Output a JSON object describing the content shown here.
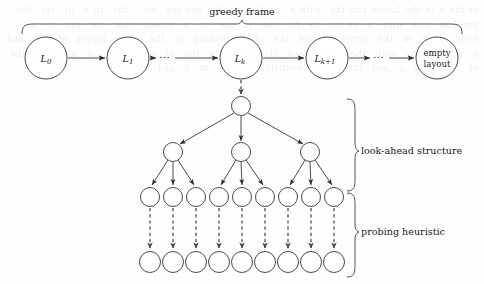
{
  "figure": {
    "background_color": "#fefefe",
    "stroke_color": "#2b2b2b",
    "dashed_stroke_color": "#4a4a4a"
  },
  "braces": {
    "greedy_frame": {
      "label": "greedy frame",
      "orientation": "top",
      "x_start": 22,
      "x_end": 462,
      "label_x": 242,
      "label_y": 15
    },
    "look_ahead": {
      "label": "look-ahead structure",
      "orientation": "right",
      "y_start": 99,
      "y_end": 191,
      "label_x": 360,
      "label_y": 151
    },
    "probing": {
      "label": "probing heuristic",
      "orientation": "right",
      "y_start": 193,
      "y_end": 277,
      "label_x": 360,
      "label_y": 232
    }
  },
  "greedy_chain": {
    "nodes": [
      {
        "id": "L0",
        "label": "L",
        "sub": "0",
        "kind": "math",
        "cx": 46,
        "cy": 58,
        "r": 21
      },
      {
        "id": "L1",
        "label": "L",
        "sub": "1",
        "kind": "math",
        "cx": 128,
        "cy": 58,
        "r": 21
      },
      {
        "id": "Lk",
        "label": "L",
        "sub": "k",
        "kind": "math",
        "cx": 241,
        "cy": 58,
        "r": 21
      },
      {
        "id": "Lk1",
        "label": "L",
        "sub": "k+1",
        "kind": "math",
        "cx": 327,
        "cy": 58,
        "r": 21
      },
      {
        "id": "empty",
        "label_line1": "empty",
        "label_line2": "layout",
        "kind": "text",
        "cx": 437,
        "cy": 58,
        "r": 21
      }
    ],
    "ellipses": [
      {
        "id": "dots-1",
        "glyph": "⋯",
        "x": 165,
        "y": 61
      },
      {
        "id": "dots-2",
        "glyph": "⋯",
        "x": 379,
        "y": 61
      }
    ],
    "arrows": [
      {
        "from": "L0",
        "to": "L1"
      },
      {
        "from": "L1",
        "to": "dots-1"
      },
      {
        "from": "dots-1",
        "to": "Lk"
      },
      {
        "from": "Lk",
        "to": "Lk1"
      },
      {
        "from": "Lk1",
        "to": "dots-2"
      },
      {
        "from": "dots-2",
        "to": "empty"
      }
    ]
  },
  "tree": {
    "root": {
      "id": "root",
      "cx": 241,
      "cy": 106,
      "r": 9.5
    },
    "link_from_greedy": {
      "from": "Lk",
      "to": "root",
      "style": "dashed"
    },
    "level2": [
      {
        "id": "n2-1",
        "cx": 173,
        "cy": 152,
        "r": 9.5
      },
      {
        "id": "n2-2",
        "cx": 241,
        "cy": 152,
        "r": 9.5
      },
      {
        "id": "n2-3",
        "cx": 310,
        "cy": 152,
        "r": 9.5
      }
    ],
    "level3": [
      {
        "id": "n3-1",
        "cx": 150,
        "cy": 197,
        "r": 9.5,
        "parent": "n2-1"
      },
      {
        "id": "n3-2",
        "cx": 173,
        "cy": 197,
        "r": 9.5,
        "parent": "n2-1"
      },
      {
        "id": "n3-3",
        "cx": 196,
        "cy": 197,
        "r": 9.5,
        "parent": "n2-1"
      },
      {
        "id": "n3-4",
        "cx": 219,
        "cy": 197,
        "r": 9.5,
        "parent": "n2-2"
      },
      {
        "id": "n3-5",
        "cx": 242,
        "cy": 197,
        "r": 9.5,
        "parent": "n2-2"
      },
      {
        "id": "n3-6",
        "cx": 265,
        "cy": 197,
        "r": 9.5,
        "parent": "n2-2"
      },
      {
        "id": "n3-7",
        "cx": 288,
        "cy": 197,
        "r": 9.5,
        "parent": "n2-3"
      },
      {
        "id": "n3-8",
        "cx": 311,
        "cy": 197,
        "r": 9.5,
        "parent": "n2-3"
      },
      {
        "id": "n3-9",
        "cx": 334,
        "cy": 197,
        "r": 9.5,
        "parent": "n2-3"
      }
    ],
    "level4": [
      {
        "id": "n4-1",
        "cx": 150,
        "cy": 262,
        "r": 10.5,
        "parent": "n3-1"
      },
      {
        "id": "n4-2",
        "cx": 173,
        "cy": 262,
        "r": 10.5,
        "parent": "n3-2"
      },
      {
        "id": "n4-3",
        "cx": 196,
        "cy": 262,
        "r": 10.5,
        "parent": "n3-3"
      },
      {
        "id": "n4-4",
        "cx": 219,
        "cy": 262,
        "r": 10.5,
        "parent": "n3-4"
      },
      {
        "id": "n4-5",
        "cx": 242,
        "cy": 262,
        "r": 10.5,
        "parent": "n3-5"
      },
      {
        "id": "n4-6",
        "cx": 265,
        "cy": 262,
        "r": 10.5,
        "parent": "n3-6"
      },
      {
        "id": "n4-7",
        "cx": 288,
        "cy": 262,
        "r": 10.5,
        "parent": "n3-7"
      },
      {
        "id": "n4-8",
        "cx": 311,
        "cy": 262,
        "r": 10.5,
        "parent": "n3-8"
      },
      {
        "id": "n4-9",
        "cx": 334,
        "cy": 262,
        "r": 10.5,
        "parent": "n3-9"
      }
    ]
  },
  "bleed_through": {
    "text": "of the a in the layout and the  with a  on the  depth  and the  for   the  in a  of  set  the  problem  and  with  a  of the  to  for  the  in  the  of  a  greedy  that  for  the  of  a  node  in  a  of  the  structure  and  the  of  a  probing  in  the  of  a  layout  of  the  and  a  set  of  the  with  the  of  a  look  the  of  a  in  the  of  an  empty  of  a  frame  the  of  the  with  a  and  the  of  a  heuristic  of  the  in  a  and  the"
  }
}
